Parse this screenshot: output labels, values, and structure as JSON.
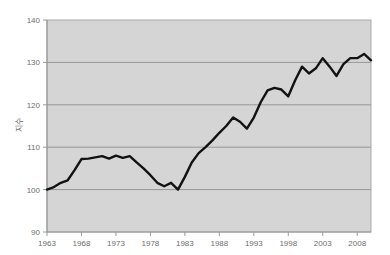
{
  "chart_data": {
    "type": "line",
    "title": "",
    "subtitle": "",
    "xlabel": "",
    "ylabel": "지수",
    "xlim": [
      1963,
      2010
    ],
    "ylim": [
      90,
      140
    ],
    "grid": true,
    "legend": "none",
    "ytick_labels": [
      "140",
      "130",
      "120",
      "110",
      "100",
      "90"
    ],
    "ytick_values": [
      140,
      130,
      120,
      110,
      100,
      90
    ],
    "xtick_labels": [
      "1963",
      "1968",
      "1973",
      "1978",
      "1983",
      "1988",
      "1993",
      "1998",
      "2003",
      "2008"
    ],
    "xtick_values": [
      1963,
      1968,
      1973,
      1978,
      1983,
      1988,
      1993,
      1998,
      2003,
      2008
    ],
    "series": [
      {
        "name": "지수",
        "color": "#121212",
        "x": [
          1963,
          1964,
          1965,
          1966,
          1967,
          1968,
          1969,
          1970,
          1971,
          1972,
          1973,
          1974,
          1975,
          1976,
          1977,
          1978,
          1979,
          1980,
          1981,
          1982,
          1983,
          1984,
          1985,
          1986,
          1987,
          1988,
          1989,
          1990,
          1991,
          1992,
          1993,
          1994,
          1995,
          1996,
          1997,
          1998,
          1999,
          2000,
          2001,
          2002,
          2003,
          2004,
          2005,
          2006,
          2007,
          2008,
          2009,
          2010
        ],
        "values": [
          100.0,
          100.6,
          101.6,
          102.2,
          104.6,
          107.2,
          107.3,
          107.6,
          107.9,
          107.3,
          108.0,
          107.5,
          107.9,
          106.4,
          105.0,
          103.4,
          101.6,
          100.8,
          101.6,
          100.0,
          103.0,
          106.4,
          108.6,
          110.0,
          111.6,
          113.4,
          115.0,
          117.0,
          116.0,
          114.4,
          117.0,
          120.6,
          123.4,
          124.0,
          123.6,
          122.0,
          125.8,
          129.0,
          127.4,
          128.6,
          131.0,
          129.0,
          126.8,
          129.6,
          131.0,
          131.0,
          132.0,
          130.5
        ]
      }
    ]
  }
}
